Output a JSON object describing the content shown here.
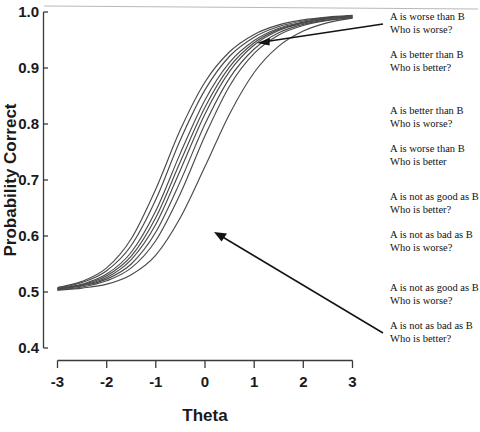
{
  "chart_data": {
    "type": "line",
    "title": "",
    "xlabel": "Theta",
    "ylabel": "Probability Correct",
    "xlim": [
      -3,
      3
    ],
    "ylim": [
      0.4,
      1.0
    ],
    "xticks": [
      "-3",
      "-2",
      "-1",
      "0",
      "1",
      "2",
      "3"
    ],
    "xtick_values": [
      -3,
      -2,
      -1,
      0,
      1,
      2,
      3
    ],
    "yticks": [
      "0.4",
      "0.5",
      "0.6",
      "0.7",
      "0.8",
      "0.9",
      "1.0"
    ],
    "ytick_values": [
      0.4,
      0.5,
      0.6,
      0.7,
      0.8,
      0.9,
      1.0
    ],
    "grid": false,
    "legend_position": "right-annotations",
    "x": [
      -3,
      -2.5,
      -2,
      -1.5,
      -1,
      -0.5,
      0,
      0.5,
      1,
      1.5,
      2,
      2.5,
      3
    ],
    "series": [
      {
        "name": "A is worse than B / Who is worse?",
        "values": [
          0.508,
          0.519,
          0.543,
          0.595,
          0.684,
          0.79,
          0.875,
          0.929,
          0.96,
          0.977,
          0.986,
          0.991,
          0.994
        ]
      },
      {
        "name": "A is better than B / Who is better?",
        "values": [
          0.507,
          0.517,
          0.538,
          0.583,
          0.665,
          0.772,
          0.861,
          0.921,
          0.955,
          0.974,
          0.984,
          0.99,
          0.993
        ]
      },
      {
        "name": "A is better than B / Who is worse?",
        "values": [
          0.506,
          0.514,
          0.532,
          0.571,
          0.645,
          0.748,
          0.843,
          0.91,
          0.949,
          0.971,
          0.982,
          0.989,
          0.993
        ]
      },
      {
        "name": "A is worse than B / Who is better",
        "values": [
          0.506,
          0.513,
          0.529,
          0.564,
          0.633,
          0.733,
          0.83,
          0.902,
          0.945,
          0.969,
          0.981,
          0.988,
          0.992
        ]
      },
      {
        "name": "A is not as good as B / Who is better?",
        "values": [
          0.505,
          0.512,
          0.526,
          0.558,
          0.621,
          0.718,
          0.818,
          0.894,
          0.941,
          0.967,
          0.98,
          0.988,
          0.991
        ]
      },
      {
        "name": "A is not as bad as B / Who is worse?",
        "values": [
          0.505,
          0.511,
          0.523,
          0.55,
          0.607,
          0.698,
          0.8,
          0.882,
          0.934,
          0.963,
          0.978,
          0.986,
          0.99
        ]
      },
      {
        "name": "A is not as good as B / Who is worse?",
        "values": [
          0.504,
          0.509,
          0.52,
          0.543,
          0.592,
          0.676,
          0.779,
          0.868,
          0.926,
          0.959,
          0.976,
          0.985,
          0.99
        ]
      },
      {
        "name": "A is not as bad as B / Who is better?",
        "values": [
          0.503,
          0.507,
          0.514,
          0.531,
          0.566,
          0.633,
          0.724,
          0.818,
          0.892,
          0.939,
          0.966,
          0.981,
          0.989
        ]
      }
    ]
  },
  "annotations": [
    {
      "line1": "A is worse than B",
      "line2": "Who is worse?"
    },
    {
      "line1": "A is better than B",
      "line2": "Who is better?"
    },
    {
      "line1": "A is better than B",
      "line2": "Who is worse?"
    },
    {
      "line1": "A is worse than B",
      "line2": "Who is better"
    },
    {
      "line1": "A is not as good as B",
      "line2": "Who is better?"
    },
    {
      "line1": "A is not as bad as B",
      "line2": "Who is worse?"
    },
    {
      "line1": "A is not as good as B",
      "line2": "Who is worse?"
    },
    {
      "line1": "A is not as bad as B",
      "line2": "Who is better?"
    }
  ]
}
